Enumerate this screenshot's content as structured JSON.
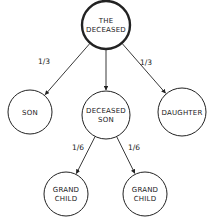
{
  "diagram": {
    "type": "inheritance-tree",
    "nodes": [
      {
        "id": "deceased",
        "lines": [
          "THE",
          "DECEASED"
        ],
        "cx": 106,
        "cy": 25,
        "r": 24,
        "stroke_width": 2.4
      },
      {
        "id": "son",
        "lines": [
          "SON"
        ],
        "cx": 30,
        "cy": 112,
        "r": 22,
        "stroke_width": 1
      },
      {
        "id": "deceased_son",
        "lines": [
          "DECEASED",
          "SON"
        ],
        "cx": 106,
        "cy": 115,
        "r": 24,
        "stroke_width": 1
      },
      {
        "id": "daughter",
        "lines": [
          "DAUGHTER"
        ],
        "cx": 182,
        "cy": 112,
        "r": 24,
        "stroke_width": 1
      },
      {
        "id": "grandchild_left",
        "lines": [
          "GRAND",
          "CHILD"
        ],
        "cx": 66,
        "cy": 194,
        "r": 22,
        "stroke_width": 1
      },
      {
        "id": "grandchild_right",
        "lines": [
          "GRAND",
          "CHILD"
        ],
        "cx": 145,
        "cy": 194,
        "r": 22,
        "stroke_width": 1
      }
    ],
    "edges": [
      {
        "from": "deceased",
        "to": "son",
        "label": "1/3",
        "label_x": 44,
        "label_y": 64
      },
      {
        "from": "deceased",
        "to": "deceased_son",
        "label": "",
        "label_x": 0,
        "label_y": 0
      },
      {
        "from": "deceased",
        "to": "daughter",
        "label": "1/3",
        "label_x": 146,
        "label_y": 65
      },
      {
        "from": "deceased_son",
        "to": "grandchild_left",
        "label": "1/6",
        "label_x": 78,
        "label_y": 150
      },
      {
        "from": "deceased_son",
        "to": "grandchild_right",
        "label": "1/6",
        "label_x": 134,
        "label_y": 150
      }
    ]
  },
  "colors": {
    "stroke": "#222222",
    "background": "#ffffff"
  }
}
